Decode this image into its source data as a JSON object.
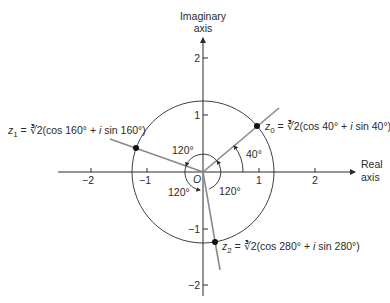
{
  "axes": {
    "imaginary_label_line1": "Imaginary",
    "imaginary_label_line2": "axis",
    "real_label_line1": "Real",
    "real_label_line2": "axis",
    "origin_label": "O",
    "x_ticks": [
      "−2",
      "−1",
      "1",
      "2"
    ],
    "y_ticks": [
      "2",
      "1",
      "−1",
      "−2"
    ]
  },
  "circle": {
    "radius_value": "∛2"
  },
  "roots": [
    {
      "name": "z",
      "sub": "0",
      "eq": " = ",
      "radical": "∛2",
      "expr": "(cos 40° + ",
      "i": "i",
      "expr2": " sin 40°)",
      "angle_deg": 40
    },
    {
      "name": "z",
      "sub": "1",
      "eq": " = ",
      "radical": "∛2",
      "expr": "(cos 160° + ",
      "i": "i",
      "expr2": " sin 160°)",
      "angle_deg": 160
    },
    {
      "name": "z",
      "sub": "2",
      "eq": " = ",
      "radical": "∛2",
      "expr": "(cos 280° + ",
      "i": "i",
      "expr2": " sin 280°)",
      "angle_deg": 280
    }
  ],
  "angle_labels": {
    "a40": "40°",
    "top": "120°",
    "left": "120°",
    "right": "120°"
  },
  "colors": {
    "axis": "#2a2a2a",
    "ray": "#8a8a8a",
    "point": "#111111"
  }
}
